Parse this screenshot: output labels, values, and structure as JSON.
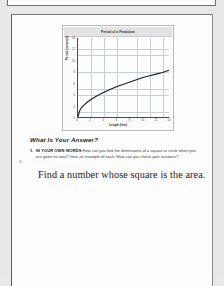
{
  "document": {
    "type": "scanned-workbook-page",
    "page_background": "#fdfdfd"
  },
  "chart_data": {
    "type": "line",
    "title": "Period of a Pendulum",
    "xlabel": "Length (feet)",
    "ylabel": "Period (seconds)",
    "xlim": [
      0,
      14
    ],
    "ylim": [
      0,
      14
    ],
    "grid": true,
    "legend": "none",
    "xticks": [
      "0",
      "2",
      "4",
      "6",
      "8",
      "10",
      "12",
      "14"
    ],
    "yticks": [
      "0",
      "2",
      "4",
      "6",
      "8",
      "10",
      "12",
      "14"
    ],
    "x": [
      0,
      0.25,
      0.5,
      1,
      1.5,
      2,
      3,
      4,
      5,
      6,
      7,
      8,
      9,
      10,
      11,
      12,
      13,
      14
    ],
    "y": [
      0,
      1.1,
      1.6,
      2.2,
      2.7,
      3.1,
      3.8,
      4.4,
      4.9,
      5.4,
      5.8,
      6.2,
      6.6,
      7.0,
      7.3,
      7.6,
      7.9,
      8.3
    ],
    "curve_note": "square-root shaped increasing curve through origin"
  },
  "section": {
    "heading": "What Is Your Answer?"
  },
  "question": {
    "number": "1.",
    "lead_in": "IN YOUR OWN WORDS",
    "text": "How can you find the dimensions of a square or circle when you are given its area? Give an example of each. How can you check your answers?"
  },
  "answer": {
    "handwritten_text": "Find a number whose square is the area."
  }
}
